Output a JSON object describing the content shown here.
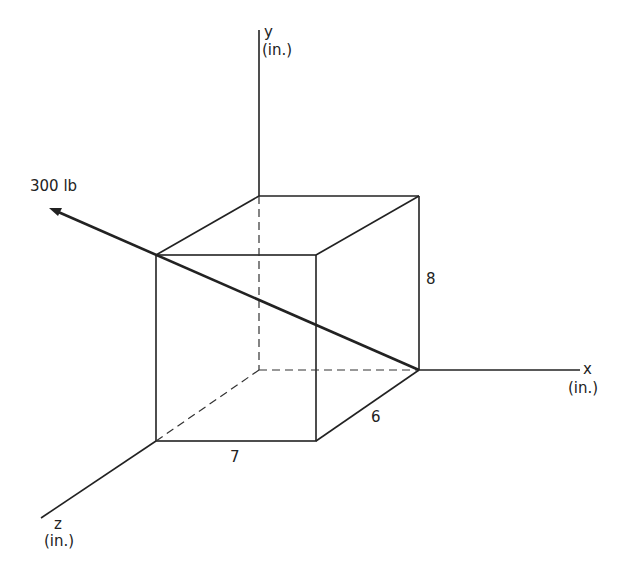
{
  "diagram": {
    "force_label": "300 lb",
    "axes": {
      "x": {
        "name": "x",
        "unit": "(in.)"
      },
      "y": {
        "name": "y",
        "unit": "(in.)"
      },
      "z": {
        "name": "z",
        "unit": "(in.)"
      }
    },
    "dimensions": {
      "width_x": "7",
      "depth_z": "6",
      "height_y": "8"
    },
    "colors": {
      "line": "#222222",
      "background": "#ffffff"
    }
  }
}
